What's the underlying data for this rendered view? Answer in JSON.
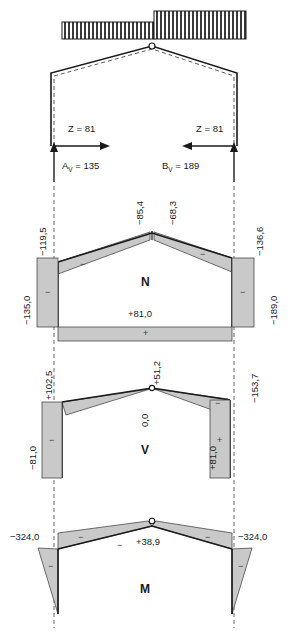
{
  "figure": {
    "colors": {
      "outline": "#1a1a1a",
      "fill": "#c9c9c9",
      "axis_dash": "#555555",
      "hatch": "#333333"
    }
  },
  "load_diagram": {
    "name": "distributed-load-block",
    "left_block_label": "",
    "right_block_label": ""
  },
  "structure": {
    "left_tie_label": "Z = 81",
    "right_tie_label": "Z = 81",
    "reaction_left": {
      "symbol": "A",
      "subscript": "V",
      "equals": "= 135",
      "full": "Aᵥ = 135"
    },
    "reaction_right": {
      "symbol": "B",
      "subscript": "V",
      "equals": "= 189",
      "full": "Bᵥ = 189"
    }
  },
  "diagrams": [
    {
      "id": "N",
      "label": "N",
      "values": {
        "left_rafter": "−119,5",
        "ridge_left": "−85,4",
        "ridge_right": "−68,3",
        "right_rafter": "−136,6",
        "left_column": "−135,0",
        "right_column": "−189,0",
        "tie": "+81,0"
      },
      "signs": {
        "left_rafter": "−",
        "right_rafter": "−",
        "left_column": "−",
        "right_column": "−",
        "tie": "+"
      }
    },
    {
      "id": "V",
      "label": "V",
      "values": {
        "left_knee": "+102,5",
        "ridge": "+51,2",
        "ridge_zero": "0,0",
        "right_knee": "−153,7",
        "left_column": "−81,0",
        "right_column": "+81,0"
      },
      "signs": {
        "right_rafter": "−",
        "left_column": "−",
        "right_column": "+"
      }
    },
    {
      "id": "M",
      "label": "M",
      "values": {
        "left_knee": "−324,0",
        "right_knee": "−324,0",
        "ridge": "+38,9"
      },
      "signs": {
        "left_rafter": "−",
        "right_rafter": "−",
        "left_column": "−",
        "right_column": "−",
        "ridge": "−"
      }
    }
  ]
}
